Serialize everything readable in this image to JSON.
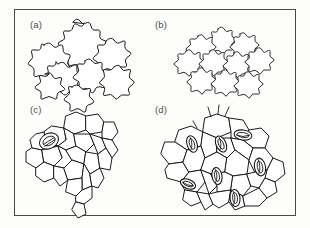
{
  "figure": {
    "background_color": "#fdfdfc",
    "frame_color": "#4a4a4a",
    "ink_color": "#1a1a1a",
    "label_color": "#4d4d4d"
  },
  "panels": [
    {
      "id": "a",
      "label": "(a)",
      "cell_wall_type": "sinuous",
      "cell_count": 11,
      "stomata_count": 0,
      "trichome_count": 0
    },
    {
      "id": "b",
      "label": "(b)",
      "cell_wall_type": "sinuous",
      "cell_count": 14,
      "stomata_count": 0,
      "trichome_count": 0
    },
    {
      "id": "c",
      "label": "(c)",
      "cell_wall_type": "polygonal",
      "cell_count": 24,
      "stomata_count": 1,
      "trichome_count": 0
    },
    {
      "id": "d",
      "label": "(d)",
      "cell_wall_type": "polygonal",
      "cell_count": 27,
      "stomata_count": 7,
      "trichome_count": 3
    }
  ]
}
